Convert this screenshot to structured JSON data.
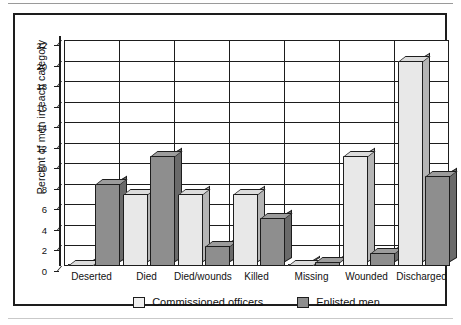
{
  "chart_data": {
    "type": "bar",
    "title": "",
    "xlabel": "",
    "ylabel": "Percent of men in each category",
    "ylim": [
      0,
      22
    ],
    "ytick_step": 2,
    "yticks": [
      0,
      2,
      4,
      6,
      8,
      10,
      12,
      14,
      16,
      18,
      20,
      22
    ],
    "grid": true,
    "legend_position": "bottom",
    "categories": [
      "Deserted",
      "Died",
      "Died/wounds",
      "Killed",
      "Missing",
      "Wounded",
      "Discharged"
    ],
    "series": [
      {
        "name": "Commissioned officers",
        "color": "#e8e8e8",
        "values": [
          0.0,
          7.0,
          7.0,
          7.0,
          0.0,
          10.7,
          20.0
        ]
      },
      {
        "name": "Enlisted men",
        "color": "#8e8e8e",
        "values": [
          8.0,
          10.7,
          1.9,
          4.7,
          0.4,
          1.3,
          8.8
        ]
      }
    ]
  },
  "legend": {
    "items": [
      {
        "label": "Commissioned officers",
        "swatch": "officers"
      },
      {
        "label": "Enlisted men",
        "swatch": "enlisted"
      }
    ]
  }
}
